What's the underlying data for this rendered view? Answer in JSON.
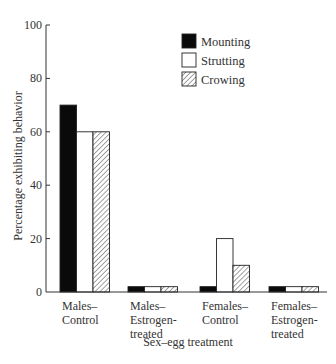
{
  "chart_data": {
    "type": "bar",
    "title": "",
    "xlabel": "Sex–egg treatment",
    "ylabel": "Percentage exhibiting behavior",
    "ylim": [
      0,
      100
    ],
    "yticks": [
      0,
      20,
      40,
      60,
      80,
      100
    ],
    "grid": false,
    "legend_position": "upper right",
    "categories": [
      [
        "Males–",
        "Control"
      ],
      [
        "Males–",
        "Estrogen-",
        "treated"
      ],
      [
        "Females–",
        "Control"
      ],
      [
        "Females–",
        "Estrogen-",
        "treated"
      ]
    ],
    "category_names": [
      "Males–Control",
      "Males–Estrogen-treated",
      "Females–Control",
      "Females–Estrogen-treated"
    ],
    "series": [
      {
        "name": "Mounting",
        "fill": "solid-black",
        "values": [
          70,
          2,
          2,
          2
        ]
      },
      {
        "name": "Strutting",
        "fill": "white",
        "values": [
          60,
          2,
          20,
          2
        ]
      },
      {
        "name": "Crowing",
        "fill": "hatched",
        "values": [
          60,
          2,
          10,
          2
        ]
      }
    ]
  },
  "colors": {
    "axis": "#333333",
    "mounting": "#0a0a0a",
    "strutting": "#ffffff",
    "crowing_hatch": "#555555",
    "outline": "#222222"
  }
}
